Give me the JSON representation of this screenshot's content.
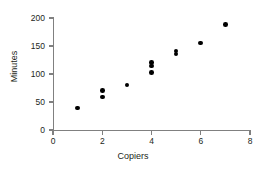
{
  "chart_data": {
    "type": "scatter",
    "title": "",
    "xlabel": "Copiers",
    "ylabel": "Minutes",
    "xlim": [
      0,
      8
    ],
    "ylim": [
      0,
      200
    ],
    "xticks": [
      0,
      2,
      4,
      6,
      8
    ],
    "yticks": [
      0,
      50,
      100,
      150,
      200
    ],
    "xticklabels": [
      "0",
      "2",
      "4",
      "6",
      "8"
    ],
    "yticklabels": [
      "0",
      "50",
      "100",
      "150",
      "200"
    ],
    "grid": false,
    "legend": false,
    "marker": "filled-circle",
    "marker_color": "#000000",
    "points": [
      {
        "x": 1,
        "y": 39
      },
      {
        "x": 2,
        "y": 71
      },
      {
        "x": 2,
        "y": 59
      },
      {
        "x": 3,
        "y": 80
      },
      {
        "x": 4,
        "y": 121
      },
      {
        "x": 4,
        "y": 114
      },
      {
        "x": 4,
        "y": 103
      },
      {
        "x": 5,
        "y": 141
      },
      {
        "x": 5,
        "y": 136
      },
      {
        "x": 6,
        "y": 155
      },
      {
        "x": 7,
        "y": 188
      }
    ]
  },
  "axes": {
    "y_title": "Minutes",
    "x_title": "Copiers"
  }
}
